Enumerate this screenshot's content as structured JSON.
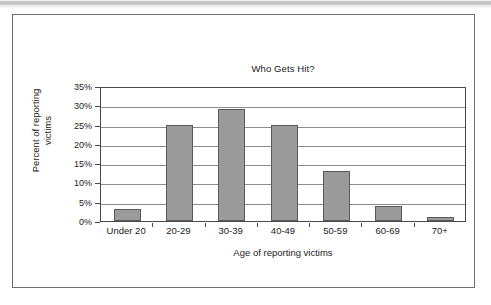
{
  "figure": {
    "frame_border_color": "#6e6e70",
    "background": "#ffffff"
  },
  "chart_data": {
    "type": "bar",
    "title": "Who Gets Hit?",
    "xlabel": "Age of reporting victims",
    "ylabel": "Percent of reporting victims",
    "ylabel_line1": "Percent of reporting",
    "ylabel_line2": "victims",
    "categories": [
      "Under 20",
      "20-29",
      "30-39",
      "40-49",
      "50-59",
      "60-69",
      "70+"
    ],
    "values": [
      3,
      25,
      29,
      25,
      13,
      4,
      1
    ],
    "ylim": [
      0,
      35
    ],
    "ytick_values": [
      0,
      5,
      10,
      15,
      20,
      25,
      30,
      35
    ],
    "ytick_labels": [
      "0%",
      "5%",
      "10%",
      "15%",
      "20%",
      "25%",
      "30%",
      "35%"
    ],
    "grid": true,
    "grid_axis": "y",
    "legend": false,
    "bar_fill_color": "#9b9b9b",
    "bar_border_color": "#5a5a5a",
    "gridline_color": "#8d8d8d",
    "axis_color": "#4a4a4a",
    "text_color": "#1b1b1b"
  }
}
